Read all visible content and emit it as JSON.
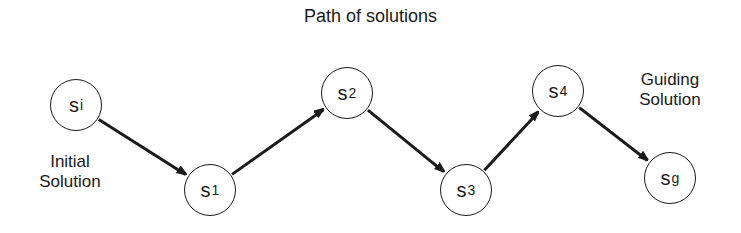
{
  "title": "Path of solutions",
  "nodes": [
    {
      "id": "si",
      "base": "s",
      "sub": "i",
      "x": 76,
      "y": 105
    },
    {
      "id": "s1",
      "base": "s",
      "sub": "1",
      "x": 210,
      "y": 190
    },
    {
      "id": "s2",
      "base": "s",
      "sub": "2",
      "x": 347,
      "y": 93
    },
    {
      "id": "s3",
      "base": "s",
      "sub": "3",
      "x": 466,
      "y": 190
    },
    {
      "id": "s4",
      "base": "s",
      "sub": "4",
      "x": 558,
      "y": 91
    },
    {
      "id": "sg",
      "base": "s",
      "sub": "g",
      "x": 670,
      "y": 178
    }
  ],
  "edges": [
    [
      "si",
      "s1"
    ],
    [
      "s1",
      "s2"
    ],
    [
      "s2",
      "s3"
    ],
    [
      "s3",
      "s4"
    ],
    [
      "s4",
      "sg"
    ]
  ],
  "labels": {
    "initial_line1": "Initial",
    "initial_line2": "Solution",
    "guiding_line1": "Guiding",
    "guiding_line2": "Solution"
  }
}
